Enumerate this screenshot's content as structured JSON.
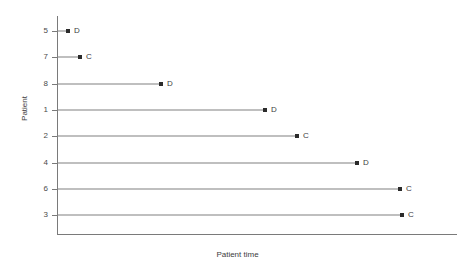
{
  "chart_data": {
    "type": "bar",
    "orientation": "horizontal",
    "title": "",
    "xlabel": "Patient time",
    "ylabel": "Patient",
    "categories": [
      "5",
      "7",
      "8",
      "1",
      "2",
      "4",
      "6",
      "3"
    ],
    "values": [
      11,
      23,
      104,
      208,
      240,
      300,
      343,
      345
    ],
    "point_labels": [
      "D",
      "C",
      "D",
      "D",
      "C",
      "D",
      "C",
      "C"
    ],
    "xlim": [
      0,
      400
    ],
    "grid": false,
    "legend": null,
    "tick_labels_y": [
      "5",
      "7",
      "8",
      "1",
      "2",
      "4",
      "6",
      "3"
    ],
    "tick_labels_x": [],
    "marker": "square",
    "marker_color": "#2b2b2b",
    "line_color": "#808080",
    "axis_color": "#7a7a7a",
    "series": [
      {
        "name": "Patient 5",
        "category": "5",
        "value": 11,
        "endpoint_label": "D"
      },
      {
        "name": "Patient 7",
        "category": "7",
        "value": 23,
        "endpoint_label": "C"
      },
      {
        "name": "Patient 8",
        "category": "8",
        "value": 104,
        "endpoint_label": "D"
      },
      {
        "name": "Patient 1",
        "category": "1",
        "value": 208,
        "endpoint_label": "D"
      },
      {
        "name": "Patient 2",
        "category": "2",
        "value": 240,
        "endpoint_label": "C"
      },
      {
        "name": "Patient 4",
        "category": "4",
        "value": 300,
        "endpoint_label": "D"
      },
      {
        "name": "Patient 6",
        "category": "6",
        "value": 343,
        "endpoint_label": "C"
      },
      {
        "name": "Patient 3",
        "category": "3",
        "value": 345,
        "endpoint_label": "C"
      }
    ]
  }
}
